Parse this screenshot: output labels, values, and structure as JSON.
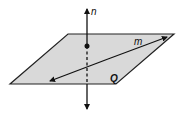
{
  "diagram": {
    "plane": {
      "label": "Q",
      "fill": "#d9d9d9",
      "stroke": "#222222",
      "points": "68,34 174,34 116,84 10,84"
    },
    "line_n": {
      "label": "n",
      "x": 87,
      "y_top": 8,
      "y_bottom": 110,
      "intersection_point": {
        "x": 87,
        "y": 46
      }
    },
    "line_m": {
      "label": "m",
      "x1": 50,
      "y1": 81,
      "x2": 167,
      "y2": 37
    }
  }
}
